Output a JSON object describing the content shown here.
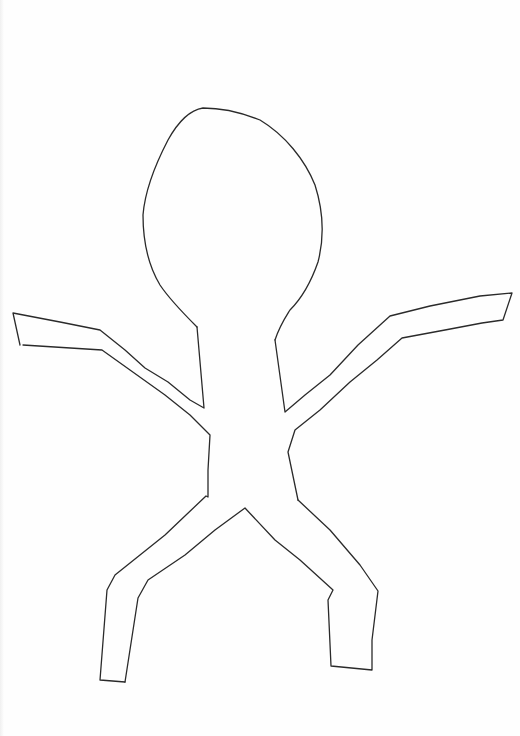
{
  "image": {
    "description": "Hand-drawn outline of a stick-like human figure on white paper",
    "subject": "figure-outline",
    "stroke_color": "#2a2a2a",
    "background_color": "#fefefe",
    "parts": [
      "head",
      "neck",
      "left-arm",
      "right-arm",
      "torso",
      "left-leg",
      "right-leg"
    ]
  }
}
